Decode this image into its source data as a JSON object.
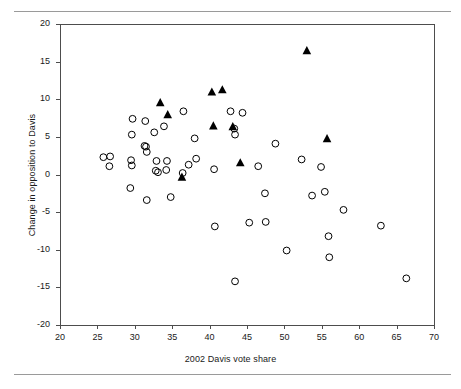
{
  "chart_data": {
    "type": "scatter",
    "title": "",
    "xlabel": "2002 Davis vote share",
    "ylabel": "Change in opposition to Davis",
    "xlim": [
      20,
      70
    ],
    "ylim": [
      -20,
      20
    ],
    "xticks": [
      20,
      25,
      30,
      35,
      40,
      45,
      50,
      55,
      60,
      65,
      70
    ],
    "yticks": [
      -20,
      -15,
      -10,
      -5,
      0,
      5,
      10,
      15,
      20
    ],
    "grid": false,
    "legend": "none",
    "series": [
      {
        "name": "open-circle",
        "marker": "open-circle",
        "color": "#000000",
        "points": [
          [
            25.8,
            2.3
          ],
          [
            26.7,
            2.4
          ],
          [
            26.6,
            1.1
          ],
          [
            29.7,
            7.4
          ],
          [
            29.6,
            5.3
          ],
          [
            29.5,
            1.9
          ],
          [
            29.6,
            1.2
          ],
          [
            29.4,
            -1.8
          ],
          [
            31.4,
            7.1
          ],
          [
            31.3,
            3.8
          ],
          [
            31.5,
            3.7
          ],
          [
            31.6,
            3.0
          ],
          [
            31.6,
            -3.4
          ],
          [
            32.6,
            5.6
          ],
          [
            32.9,
            1.8
          ],
          [
            32.8,
            0.5
          ],
          [
            33.1,
            0.3
          ],
          [
            33.9,
            6.4
          ],
          [
            34.3,
            1.8
          ],
          [
            34.2,
            0.6
          ],
          [
            34.8,
            -3.0
          ],
          [
            36.4,
            0.2
          ],
          [
            36.5,
            8.4
          ],
          [
            37.2,
            1.3
          ],
          [
            38.0,
            4.8
          ],
          [
            38.2,
            2.1
          ],
          [
            40.6,
            0.7
          ],
          [
            40.7,
            -6.9
          ],
          [
            42.8,
            8.4
          ],
          [
            43.3,
            6.1
          ],
          [
            43.4,
            5.3
          ],
          [
            43.4,
            -14.2
          ],
          [
            44.4,
            8.2
          ],
          [
            45.3,
            -6.4
          ],
          [
            46.5,
            1.1
          ],
          [
            47.4,
            -2.5
          ],
          [
            47.5,
            -6.3
          ],
          [
            48.8,
            4.1
          ],
          [
            50.3,
            -10.1
          ],
          [
            52.3,
            2.0
          ],
          [
            53.7,
            -2.8
          ],
          [
            54.9,
            1.0
          ],
          [
            55.4,
            -2.3
          ],
          [
            55.9,
            -8.2
          ],
          [
            56.0,
            -11.0
          ],
          [
            57.9,
            -4.7
          ],
          [
            62.9,
            -6.8
          ],
          [
            66.3,
            -13.8
          ]
        ]
      },
      {
        "name": "filled-triangle",
        "marker": "filled-triangle",
        "color": "#000000",
        "points": [
          [
            33.4,
            9.5
          ],
          [
            34.4,
            7.9
          ],
          [
            36.3,
            -0.4
          ],
          [
            40.3,
            10.9
          ],
          [
            40.5,
            6.4
          ],
          [
            41.7,
            11.2
          ],
          [
            43.1,
            6.3
          ],
          [
            44.1,
            1.5
          ],
          [
            53.0,
            16.4
          ],
          [
            55.7,
            4.7
          ]
        ]
      }
    ]
  },
  "axes": {
    "x_title": "2002 Davis vote share",
    "y_title": "Change in opposition to Davis",
    "x_tick_labels": [
      "20",
      "25",
      "30",
      "35",
      "40",
      "45",
      "50",
      "55",
      "60",
      "65",
      "70"
    ],
    "y_tick_labels": [
      "20",
      "15",
      "10",
      "5",
      "0",
      "-5",
      "-10",
      "-15",
      "-20"
    ]
  },
  "style": {
    "axis_color": "#4d4d4d",
    "marker_color": "#000000",
    "rule_color": "#9a9a9a",
    "background": "#ffffff"
  }
}
